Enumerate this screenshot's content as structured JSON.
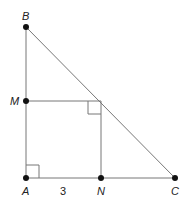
{
  "diagram": {
    "type": "geometry",
    "colors": {
      "line": "#777777",
      "point": "#111111",
      "text": "#222222",
      "background": "#ffffff"
    },
    "points": {
      "B": {
        "label": "B",
        "x": 26,
        "y": 27
      },
      "M": {
        "label": "M",
        "x": 26,
        "y": 101
      },
      "A": {
        "label": "A",
        "x": 26,
        "y": 178
      },
      "N": {
        "label": "N",
        "x": 101,
        "y": 178
      },
      "C": {
        "label": "C",
        "x": 175,
        "y": 178
      },
      "P": {
        "label": "",
        "x": 101,
        "y": 101
      }
    },
    "segments": [
      [
        "B",
        "A"
      ],
      [
        "A",
        "C"
      ],
      [
        "B",
        "C"
      ],
      [
        "M",
        "P"
      ],
      [
        "P",
        "N"
      ]
    ],
    "right_angle_marks": [
      "A",
      "P"
    ],
    "measurements": {
      "AN": "3"
    }
  }
}
